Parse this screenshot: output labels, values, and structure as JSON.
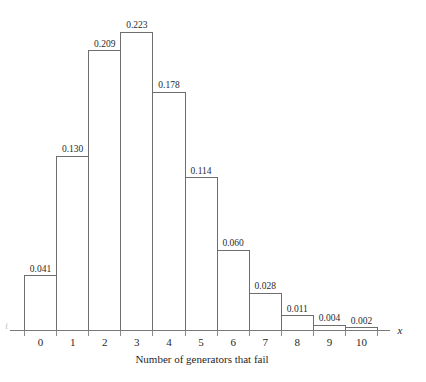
{
  "chart_data": {
    "type": "bar",
    "title": "",
    "xlabel": "Number of generators that fail",
    "ylabel": "",
    "axis_variable": "x",
    "categories": [
      "0",
      "1",
      "2",
      "3",
      "4",
      "5",
      "6",
      "7",
      "8",
      "9",
      "10"
    ],
    "values": [
      0.041,
      0.13,
      0.209,
      0.223,
      0.178,
      0.114,
      0.06,
      0.028,
      0.011,
      0.004,
      0.002
    ],
    "data_labels": [
      "0.041",
      "0.130",
      "0.209",
      "0.223",
      "0.178",
      "0.114",
      "0.060",
      "0.028",
      "0.011",
      "0.004",
      "0.002"
    ],
    "ylim": [
      0,
      0.223
    ],
    "grid": false,
    "legend": null,
    "bar_style": {
      "fill": "#ffffff",
      "stroke": "#6e6e6e"
    }
  },
  "axis": {
    "variable_label": "x",
    "title": "Number of generators that fail",
    "tick_labels": [
      "0",
      "1",
      "2",
      "3",
      "4",
      "5",
      "6",
      "7",
      "8",
      "9",
      "10"
    ],
    "baseline_color": "#7a7a7a"
  },
  "edge": {
    "clipped_label": "f"
  }
}
